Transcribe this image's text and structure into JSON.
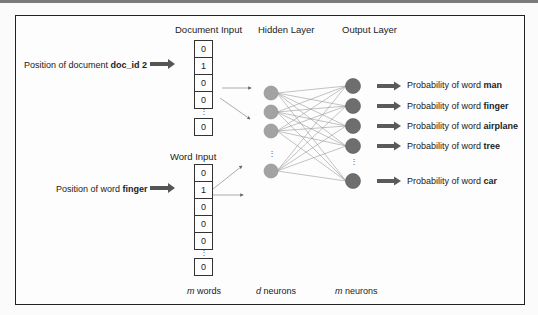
{
  "diagram": {
    "headers": {
      "document_input": "Document Input",
      "hidden_layer": "Hidden Layer",
      "output_layer": "Output Layer",
      "word_input": "Word Input"
    },
    "document_label": {
      "prefix": "Position of document ",
      "bold": "doc_id 2"
    },
    "word_label": {
      "prefix": "Position of word ",
      "bold": "finger"
    },
    "document_vector": [
      "0",
      "1",
      "0",
      "0",
      "0"
    ],
    "word_vector": [
      "0",
      "1",
      "0",
      "0",
      "0",
      "0"
    ],
    "ellipsis": "⋮",
    "outputs": [
      {
        "prefix": "Probability of word ",
        "bold": "man"
      },
      {
        "prefix": "Probability of word ",
        "bold": "finger"
      },
      {
        "prefix": "Probability of word ",
        "bold": "airplane"
      },
      {
        "prefix": "Probability of word ",
        "bold": "tree"
      },
      {
        "prefix": "Probability of word ",
        "bold": "car"
      }
    ],
    "footers": {
      "input": {
        "var": "m",
        "text": " words"
      },
      "hidden": {
        "var": "d",
        "text": " neurons"
      },
      "output": {
        "var": "m",
        "text": " neurons"
      }
    },
    "colors": {
      "hidden_node": "#a3a3a3",
      "output_node": "#6e6e6e",
      "arrow": "#5a5a5a",
      "edge": "#9a9a9a"
    }
  }
}
